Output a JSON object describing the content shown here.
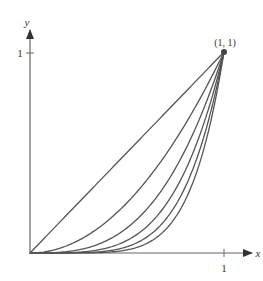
{
  "chart_data": {
    "type": "line",
    "title": "",
    "xlabel": "x",
    "ylabel": "y",
    "xlim": [
      0,
      1.1
    ],
    "ylim": [
      0,
      1.1
    ],
    "x_ticks": [
      {
        "value": 1,
        "label": "1"
      }
    ],
    "y_ticks": [
      {
        "value": 1,
        "label": "1"
      }
    ],
    "grid": false,
    "legend": null,
    "annotations": [
      {
        "x": 1,
        "y": 1,
        "text": "(1, 1)",
        "marker": "dot"
      }
    ],
    "series": [
      {
        "name": "y = x",
        "exponent": 1
      },
      {
        "name": "y = x^2",
        "exponent": 2
      },
      {
        "name": "y = x^3",
        "exponent": 3
      },
      {
        "name": "y = x^4",
        "exponent": 4
      },
      {
        "name": "y = x^5",
        "exponent": 5
      },
      {
        "name": "y = x^6",
        "exponent": 6
      }
    ],
    "sample_points": {
      "x": [
        0,
        0.25,
        0.5,
        0.75,
        1
      ],
      "y = x": [
        0,
        0.25,
        0.5,
        0.75,
        1
      ],
      "y = x^2": [
        0,
        0.0625,
        0.25,
        0.5625,
        1
      ],
      "y = x^3": [
        0,
        0.0156,
        0.125,
        0.4219,
        1
      ],
      "y = x^4": [
        0,
        0.0039,
        0.0625,
        0.3164,
        1
      ],
      "y = x^5": [
        0,
        0.001,
        0.0313,
        0.2373,
        1
      ],
      "y = x^6": [
        0,
        0.0002,
        0.0156,
        0.178,
        1
      ]
    }
  },
  "labels": {
    "x_axis": "x",
    "y_axis": "y",
    "x_tick": "1",
    "y_tick": "1",
    "point": "(1, 1)"
  },
  "colors": {
    "axis": "#555555",
    "curve": "#555555",
    "text": "#333333"
  }
}
